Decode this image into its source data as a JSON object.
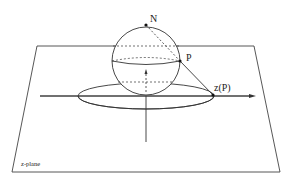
{
  "figure": {
    "type": "stereographic-projection",
    "labels": {
      "north_pole": "N",
      "point": "P",
      "projection": "z(P)",
      "plane": "z-plane"
    }
  },
  "colors": {
    "stroke": "#333333",
    "background": "#ffffff"
  }
}
